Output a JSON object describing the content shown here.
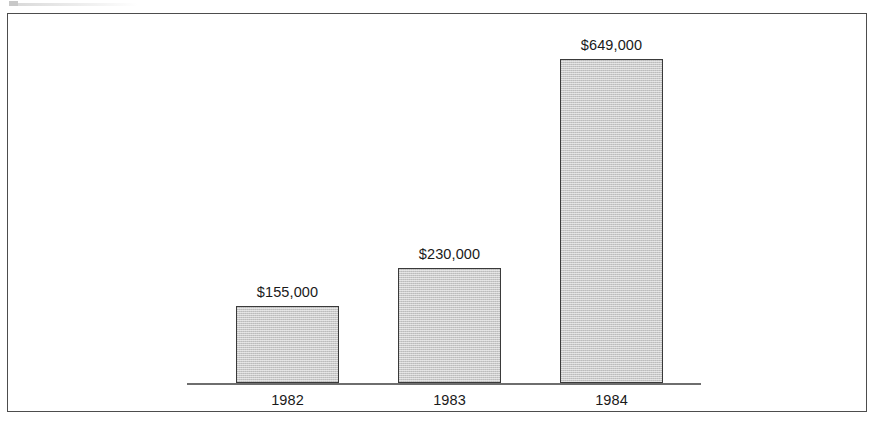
{
  "figure": {
    "background_color": "#ffffff",
    "frame_color": "#2b2b2b",
    "axis_color": "#6e6e6e",
    "bar_fill_color": "#c9c9c9",
    "bar_border_color": "#3a3a3a",
    "label_color": "#1a1a1a"
  },
  "chart_data": {
    "type": "bar",
    "title": "",
    "subtitle": "",
    "xlabel": "",
    "ylabel": "",
    "categories": [
      "1982",
      "1983",
      "1984"
    ],
    "values": [
      155000,
      230000,
      649000
    ],
    "value_labels": [
      "$155,000",
      "$230,000",
      "$649,000"
    ],
    "ylim": [
      0,
      700000
    ],
    "grid": false,
    "legend": null,
    "legend_position": "none",
    "annotations": [],
    "axis": {
      "x_axis_visible": true,
      "y_axis_visible": false,
      "y_ticks_visible": false,
      "x_tick_labels": [
        "1982",
        "1983",
        "1984"
      ]
    },
    "units": "USD",
    "series": [
      {
        "name": "",
        "values": [
          155000,
          230000,
          649000
        ]
      }
    ]
  }
}
